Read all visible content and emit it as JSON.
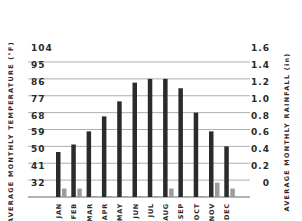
{
  "chart_data": {
    "type": "bar",
    "title": "",
    "categories": [
      "JAN",
      "FEB",
      "MAR",
      "APR",
      "MAY",
      "JUN",
      "JUL",
      "AUG",
      "SEP",
      "OCT",
      "NOV",
      "DEC"
    ],
    "series": [
      {
        "name": "Average Monthly Temperature (°F)",
        "axis": "left",
        "color": "#2b2b2b",
        "values": [
          56,
          60,
          67,
          75,
          83,
          93,
          95,
          95,
          90,
          77,
          67,
          59
        ]
      },
      {
        "name": "Average Monthly Rainfall (in)",
        "axis": "right",
        "color": "#9b9b9b",
        "values": [
          0.1,
          0.1,
          0.01,
          0.01,
          0.01,
          0.01,
          0.01,
          0.1,
          0.01,
          0.01,
          0.17,
          0.1
        ]
      }
    ],
    "ylabel_left": "AVERAGE MONTHLY TEMPERATURE (°F)",
    "ylabel_right": "AVERAGE MONTHLY RAINFALL (in)",
    "xlabel": "",
    "left_ticks": [
      "32",
      "41",
      "50",
      "59",
      "68",
      "77",
      "86",
      "95",
      "104"
    ],
    "right_ticks": [
      "0",
      "0.2",
      "0.4",
      "0.6",
      "0.8",
      "1.0",
      "1.2",
      "1.4",
      "1.6"
    ],
    "ylim_left": [
      32,
      104
    ],
    "ylim_right": [
      0,
      1.6
    ],
    "grid": true,
    "legend": "none"
  }
}
